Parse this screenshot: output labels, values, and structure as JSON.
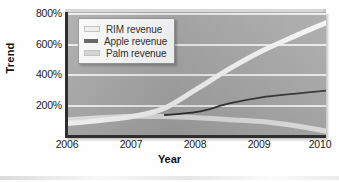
{
  "chart_data": {
    "type": "line",
    "title": "",
    "xlabel": "Year",
    "ylabel": "Trend",
    "xlim": [
      2006,
      2010
    ],
    "ylim": [
      0,
      800
    ],
    "xticks": [
      "2006",
      "2007",
      "2008",
      "2009",
      "2010"
    ],
    "xtick_values": [
      2006,
      2007,
      2008,
      2009,
      2010
    ],
    "yticks": [
      "200%",
      "400%",
      "600%",
      "800%"
    ],
    "ytick_values": [
      200,
      400,
      600,
      800
    ],
    "grid": "horizontal",
    "legend_position": "top-left",
    "x": [
      2006,
      2006.5,
      2007,
      2007.5,
      2008,
      2008.5,
      2009,
      2009.5,
      2010
    ],
    "series": [
      {
        "name": "RIM revenue",
        "color": "#f5f5f5",
        "width": 5,
        "values": [
          75,
          95,
          120,
          175,
          300,
          430,
          545,
          640,
          730
        ]
      },
      {
        "name": "Apple revenue",
        "color": "#2b2b2b",
        "width": 1.8,
        "x_start": 2007.5,
        "values": [
          null,
          null,
          null,
          130,
          150,
          205,
          245,
          268,
          288
        ]
      },
      {
        "name": "Palm revenue",
        "color": "#dedede",
        "width": 5,
        "values": [
          100,
          112,
          122,
          120,
          112,
          100,
          88,
          62,
          25
        ]
      }
    ]
  },
  "legend": {
    "items": [
      {
        "label": "RIM revenue",
        "color": "#f2f2f2"
      },
      {
        "label": "Apple revenue",
        "color": "#555555"
      },
      {
        "label": "Palm revenue",
        "color": "#d5d5d5"
      }
    ]
  },
  "axes": {
    "y_title": "Trend",
    "x_title": "Year",
    "y_tick_labels": [
      "800%",
      "600%",
      "400%",
      "200%"
    ],
    "x_tick_labels": [
      "2006",
      "2007",
      "2008",
      "2009",
      "2010"
    ]
  },
  "colors": {
    "plot_background": "#a3a3a3",
    "gridline": "#f2f2f2",
    "axis": "#2e2e2e",
    "page_background": "#fefefe"
  }
}
